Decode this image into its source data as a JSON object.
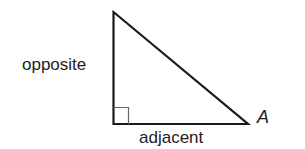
{
  "diagram": {
    "type": "right-triangle",
    "labels": {
      "vertical_leg": "opposite",
      "horizontal_leg": "adjacent",
      "angle_vertex": "A"
    },
    "colors": {
      "stroke": "#1a1a1a",
      "right_angle_marker": "#555555",
      "text": "#222222"
    }
  }
}
